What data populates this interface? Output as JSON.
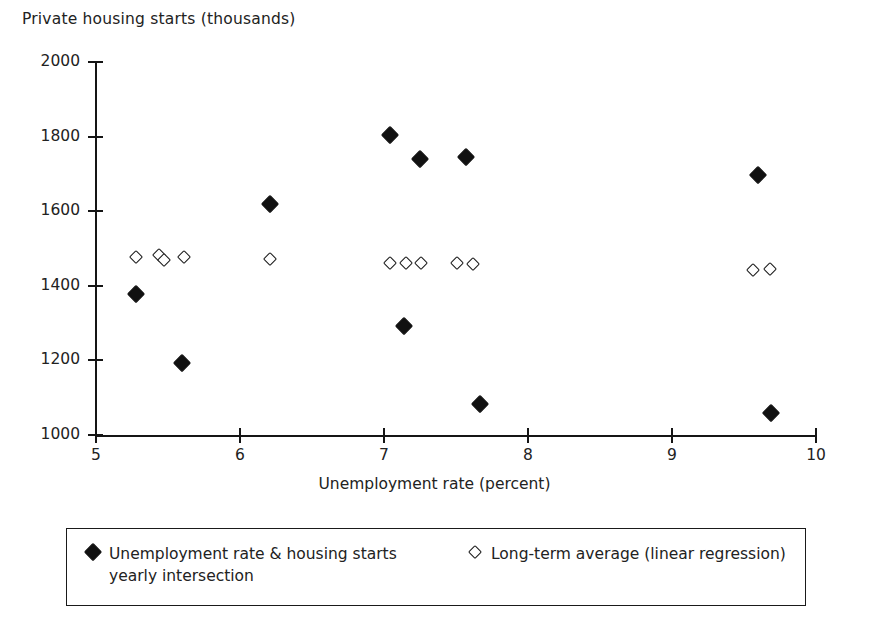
{
  "chart_data": {
    "type": "scatter",
    "title": "",
    "ylabel": "Private housing starts (thousands)",
    "xlabel": "Unemployment rate (percent)",
    "xlim": [
      5,
      10
    ],
    "ylim": [
      1000,
      2000
    ],
    "xticks": [
      5,
      6,
      7,
      8,
      9,
      10
    ],
    "yticks": [
      1000,
      1200,
      1400,
      1600,
      1800,
      2000
    ],
    "xtick_labels": [
      "5",
      "6",
      "7",
      "8",
      "9",
      "10"
    ],
    "ytick_labels": [
      "1000",
      "1200",
      "1400",
      "1600",
      "1800",
      "2000"
    ],
    "grid": false,
    "legend_position": "below-axes",
    "series": [
      {
        "name": "Unemployment rate & housing starts yearly intersection",
        "marker": "filled-diamond",
        "color": "#111111",
        "points": [
          {
            "x": 5.28,
            "y": 1378
          },
          {
            "x": 5.6,
            "y": 1193
          },
          {
            "x": 6.21,
            "y": 1620
          },
          {
            "x": 7.04,
            "y": 1805
          },
          {
            "x": 7.14,
            "y": 1292
          },
          {
            "x": 7.25,
            "y": 1740
          },
          {
            "x": 7.57,
            "y": 1745
          },
          {
            "x": 7.67,
            "y": 1083
          },
          {
            "x": 9.6,
            "y": 1698
          },
          {
            "x": 9.69,
            "y": 1058
          }
        ]
      },
      {
        "name": "Long-term average (linear regression)",
        "marker": "hollow-diamond",
        "color": "#1a1a1a",
        "points": [
          {
            "x": 5.28,
            "y": 1477
          },
          {
            "x": 5.44,
            "y": 1482
          },
          {
            "x": 5.47,
            "y": 1468
          },
          {
            "x": 5.61,
            "y": 1477
          },
          {
            "x": 6.21,
            "y": 1473
          },
          {
            "x": 7.04,
            "y": 1461
          },
          {
            "x": 7.15,
            "y": 1461
          },
          {
            "x": 7.26,
            "y": 1461
          },
          {
            "x": 7.51,
            "y": 1461
          },
          {
            "x": 7.62,
            "y": 1458
          },
          {
            "x": 9.56,
            "y": 1443
          },
          {
            "x": 9.68,
            "y": 1445
          }
        ]
      }
    ]
  },
  "legend": {
    "entries": [
      {
        "label": "Unemployment rate & housing starts yearly intersection",
        "marker": "filled-diamond"
      },
      {
        "label": "Long-term average (linear regression)",
        "marker": "hollow-diamond"
      }
    ]
  }
}
